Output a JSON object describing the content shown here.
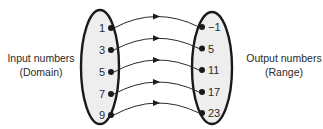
{
  "figure": {
    "left_label": {
      "line1": "Input numbers",
      "line2": "(Domain)"
    },
    "right_label": {
      "line1": "Output numbers",
      "line2": "(Range)"
    },
    "domain": [
      "1",
      "3",
      "5",
      "7",
      "9"
    ],
    "range": [
      "−1",
      "5",
      "11",
      "17",
      "23"
    ],
    "mappings": [
      {
        "from": "1",
        "to": "−1"
      },
      {
        "from": "3",
        "to": "5"
      },
      {
        "from": "5",
        "to": "11"
      },
      {
        "from": "7",
        "to": "17"
      },
      {
        "from": "9",
        "to": "23"
      }
    ],
    "colors": {
      "oval_fill": "#eeeeee",
      "oval_outline": "#1a1a1a",
      "text": "#2b2a2a",
      "arrow": "#2a2a2a"
    }
  }
}
